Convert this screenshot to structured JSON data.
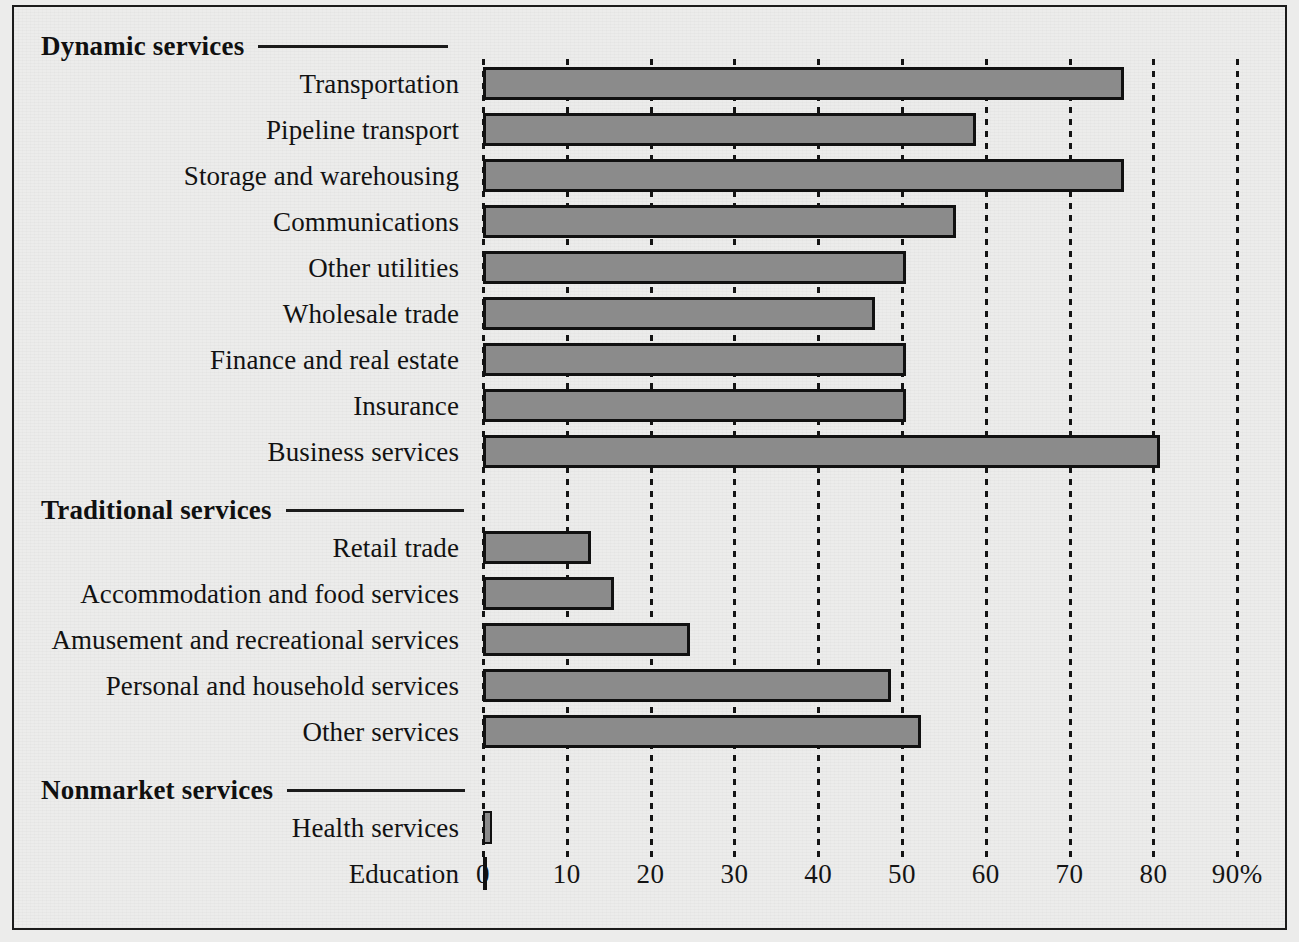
{
  "chart_data": {
    "type": "bar",
    "orientation": "horizontal",
    "title": "",
    "xlabel": "",
    "ylabel": "",
    "xlim": [
      0,
      90
    ],
    "xticks": [
      0,
      10,
      20,
      30,
      40,
      50,
      60,
      70,
      80,
      90
    ],
    "xtick_labels": [
      "0",
      "10",
      "20",
      "30",
      "40",
      "50",
      "60",
      "70",
      "80",
      "90%"
    ],
    "grid": true,
    "legend": null,
    "bar_fill_color": "#8b8b8b",
    "bar_edge_color": "#111111",
    "background_color": "#ececeb",
    "groups": [
      {
        "name": "Dynamic services",
        "categories": [
          "Transportation",
          "Pipeline transport",
          "Storage and warehousing",
          "Communications",
          "Other utilities",
          "Wholesale trade",
          "Finance and real estate",
          "Insurance",
          "Business services"
        ],
        "values": [
          76.5,
          58.8,
          76.5,
          56.5,
          50.5,
          46.8,
          50.5,
          50.5,
          80.8
        ]
      },
      {
        "name": "Traditional services",
        "categories": [
          "Retail trade",
          "Accommodation and food services",
          "Amusement and recreational services",
          "Personal and household services",
          "Other services"
        ],
        "values": [
          12.9,
          15.6,
          24.7,
          48.7,
          52.3
        ]
      },
      {
        "name": "Nonmarket services",
        "categories": [
          "Health services",
          "Education"
        ],
        "values": [
          1.1,
          0.2
        ]
      }
    ]
  }
}
